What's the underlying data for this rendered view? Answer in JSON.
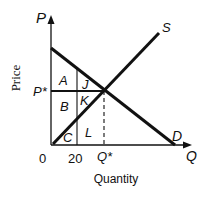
{
  "diagram": {
    "axes": {
      "y_axis_symbol": "P",
      "x_axis_symbol": "Q",
      "y_axis_label": "Price",
      "x_axis_label": "Quantity",
      "origin_label": "0"
    },
    "curves": {
      "supply_label": "S",
      "demand_label": "D"
    },
    "equilibrium": {
      "price_label": "P*",
      "quantity_label": "Q*"
    },
    "tick_labels": {
      "q20": "20"
    },
    "regions": {
      "A": "A",
      "J": "J",
      "B": "B",
      "K": "K",
      "C": "C",
      "L": "L"
    },
    "colors": {
      "line": "#111111",
      "background": "#ffffff"
    }
  }
}
